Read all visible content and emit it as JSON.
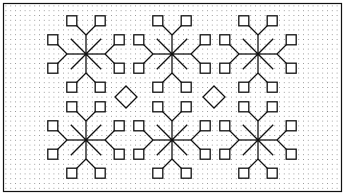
{
  "pattern": {
    "title": "Blackwork embroidery chart",
    "colors": {
      "background": "#ffffff",
      "ink": "#111111",
      "dot": "#8a8a8a"
    },
    "frame": {
      "x": 3.5,
      "y": 3.5,
      "w": 338,
      "h": 188
    },
    "grid": {
      "pitch": 4.8,
      "dot_radius": 0.55
    },
    "motif": {
      "type": "snowflake",
      "ray_length": 19,
      "stem_offset": 19,
      "branch_dx": 10,
      "branch_dy": 10,
      "square_size": 10
    },
    "motifs": [
      {
        "cx": 86,
        "cy": 54
      },
      {
        "cx": 172,
        "cy": 54
      },
      {
        "cx": 258,
        "cy": 54
      },
      {
        "cx": 86,
        "cy": 140
      },
      {
        "cx": 172,
        "cy": 140
      },
      {
        "cx": 258,
        "cy": 140
      }
    ],
    "diamonds": [
      {
        "cx": 126,
        "cy": 97,
        "r": 11
      },
      {
        "cx": 214,
        "cy": 97,
        "r": 11
      }
    ]
  }
}
